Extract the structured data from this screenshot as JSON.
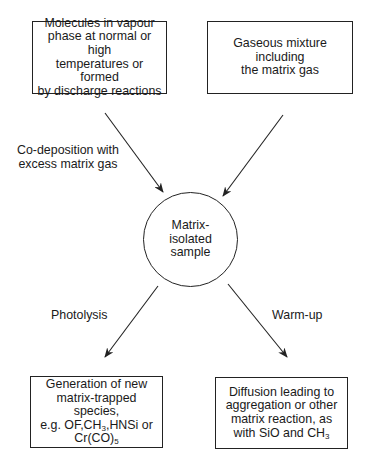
{
  "diagram": {
    "nodes": {
      "source_molecules": {
        "lines": [
          "Molecules in vapour",
          "phase at normal or high",
          "temperatures or formed",
          "by discharge reactions"
        ]
      },
      "matrix_gas": {
        "lines": [
          "Gaseous mixture including",
          "the matrix gas"
        ]
      },
      "sample": {
        "lines": [
          "Matrix-",
          "isolated",
          "sample"
        ]
      },
      "photolysis_result": {
        "line1": "Generation of new",
        "line2": "matrix-trapped species,",
        "line3_pre": "e.g. OF,CH",
        "line3_sub": "3",
        "line3_post": ",HNSi or",
        "line4_pre": "Cr(CO)",
        "line4_sub": "5"
      },
      "warmup_result": {
        "line1": "Diffusion leading to",
        "line2": "aggregation or other",
        "line3": "matrix reaction, as",
        "line4_pre": "with SiO and CH",
        "line4_sub": "3"
      }
    },
    "edge_labels": {
      "codeposition": [
        "Co-deposition with",
        "excess matrix gas"
      ],
      "photolysis": "Photolysis",
      "warmup": "Warm-up"
    },
    "edges": [
      {
        "from": "source_molecules",
        "to": "sample",
        "label": "codeposition"
      },
      {
        "from": "matrix_gas",
        "to": "sample"
      },
      {
        "from": "sample",
        "to": "photolysis_result",
        "label": "photolysis"
      },
      {
        "from": "sample",
        "to": "warmup_result",
        "label": "warmup"
      }
    ]
  }
}
